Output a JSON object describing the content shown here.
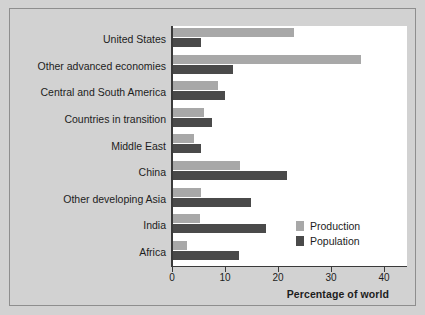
{
  "chart_data": {
    "type": "bar",
    "orientation": "horizontal",
    "title": "",
    "xlabel": "Percentage of world",
    "ylabel": "",
    "xlim": [
      0,
      44
    ],
    "xticks": [
      0,
      10,
      20,
      30,
      40
    ],
    "xtick_labels": [
      "0",
      "10",
      "20",
      "30",
      "40"
    ],
    "grid": false,
    "legend_position": "lower right",
    "categories": [
      "United States",
      "Other advanced economies",
      "Central and South America",
      "Countries in transition",
      "Middle East",
      "China",
      "Other developing Asia",
      "India",
      "Africa"
    ],
    "series": [
      {
        "name": "Production",
        "color": "#a8a8a8",
        "values": [
          22.8,
          35.5,
          8.5,
          5.9,
          4.0,
          12.6,
          5.3,
          5.1,
          2.7
        ]
      },
      {
        "name": "Population",
        "color": "#4a4a4a",
        "values": [
          5.3,
          11.3,
          9.8,
          7.4,
          5.3,
          21.5,
          14.7,
          17.5,
          12.5
        ]
      }
    ]
  },
  "colors": {
    "page_background": "#d2d2d2",
    "plot_background": "#ffffff",
    "axis": "#3a3a3a",
    "text": "#1d1d1d",
    "production": "#a8a8a8",
    "population": "#4a4a4a"
  }
}
